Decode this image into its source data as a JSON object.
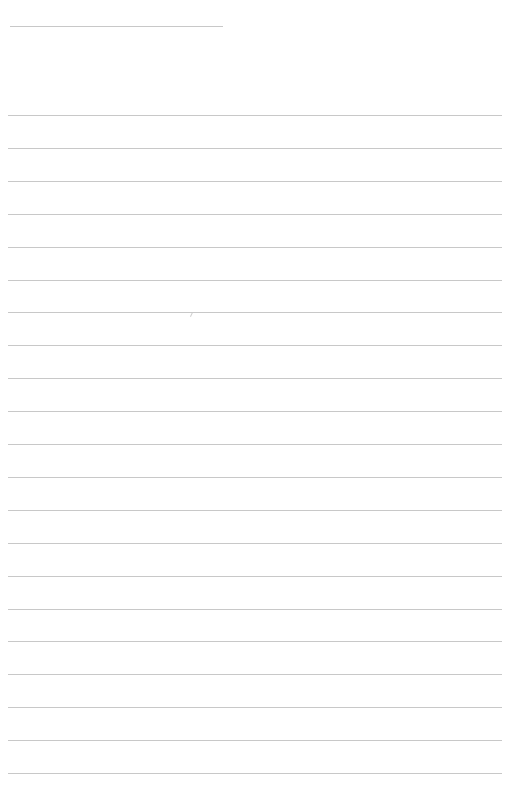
{
  "page": {
    "type": "blank lined paper",
    "background": "#ffffff",
    "line_color": "#c8c8c8",
    "header_line": {
      "x": 10,
      "y": 26,
      "width": 213
    },
    "ruled_lines": {
      "count": 21,
      "first_y": 115,
      "spacing": 32.9,
      "x": 8,
      "width": 494
    },
    "content_text": []
  }
}
